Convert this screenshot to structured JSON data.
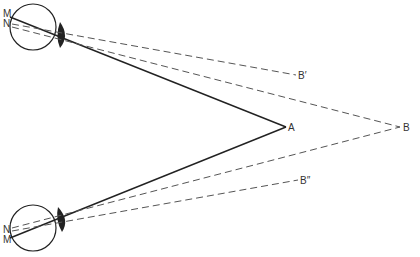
{
  "diagram": {
    "title": "",
    "colors": {
      "line": "#222222",
      "dashed": "#555555",
      "background": "#ffffff"
    },
    "points": {
      "A": {
        "label": "A",
        "x": 286,
        "y": 127
      },
      "B": {
        "label": "B",
        "x": 400,
        "y": 127
      },
      "B_prime": {
        "label": "B′",
        "x": 296,
        "y": 75
      },
      "B_double_prime": {
        "label": "B″",
        "x": 298,
        "y": 180
      }
    },
    "eyes": [
      {
        "name": "top-eye",
        "cx": 33,
        "cy": 27,
        "r": 23,
        "labels": {
          "M": "M",
          "N": "N"
        }
      },
      {
        "name": "bottom-eye",
        "cx": 33,
        "cy": 228,
        "r": 23,
        "labels": {
          "N": "N",
          "M": "M"
        }
      }
    ]
  }
}
